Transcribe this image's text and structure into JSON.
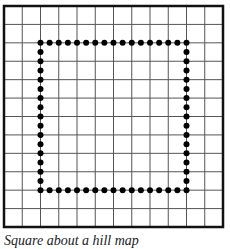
{
  "diagram": {
    "type": "grid-with-dotted-square",
    "grid": {
      "columns": 12,
      "rows": 12,
      "left": 4,
      "top": 6,
      "right": 223,
      "bottom": 227,
      "line_color": "#555555",
      "border_color": "#111111"
    },
    "square": {
      "from_col": 2,
      "to_col": 10,
      "from_row": 2,
      "to_row": 10,
      "dots_per_cell": 2,
      "dots_per_side": 17,
      "dot_radius": 3,
      "dot_color": "#000000"
    }
  },
  "caption": "Square about a hill map"
}
